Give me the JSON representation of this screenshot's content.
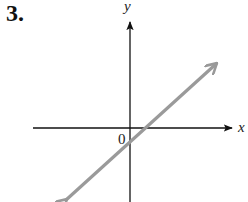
{
  "problem": {
    "number_label": "3."
  },
  "axes": {
    "x_label": "x",
    "y_label": "y",
    "origin_label": "0",
    "axis_color": "#111111"
  },
  "line": {
    "color": "#999999",
    "description": "straight line with positive slope, arrows at both ends",
    "x_intercept": "positive",
    "y_intercept": "negative"
  }
}
